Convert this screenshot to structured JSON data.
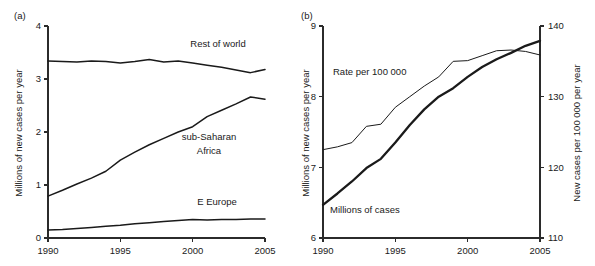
{
  "figure": {
    "panel_a_label": "(a)",
    "panel_b_label": "(b)"
  },
  "chart_data": [
    {
      "type": "line",
      "panel": "(a)",
      "title": "",
      "xlabel": "",
      "ylabel": "Millions of new cases per year",
      "xlim": [
        1990,
        2005
      ],
      "ylim": [
        0,
        4
      ],
      "xticks": [
        1990,
        1995,
        2000,
        2005
      ],
      "xtick_labels": [
        "1990",
        "1995",
        "2000",
        "2005"
      ],
      "yticks": [
        0,
        1,
        2,
        3,
        4
      ],
      "ytick_labels": [
        "0",
        "1",
        "2",
        "3",
        "4"
      ],
      "grid": false,
      "legend": "inline-annotations",
      "x": [
        1990,
        1991,
        1992,
        1993,
        1994,
        1995,
        1996,
        1997,
        1998,
        1999,
        2000,
        2001,
        2002,
        2003,
        2004,
        2005
      ],
      "series": [
        {
          "name": "Rest of world",
          "label": "Rest of world",
          "values": [
            3.34,
            3.33,
            3.32,
            3.34,
            3.33,
            3.3,
            3.33,
            3.37,
            3.32,
            3.34,
            3.3,
            3.26,
            3.22,
            3.17,
            3.12,
            3.18
          ]
        },
        {
          "name": "sub-Saharan Africa",
          "label": "sub-Saharan Africa",
          "values": [
            0.79,
            0.9,
            1.02,
            1.13,
            1.26,
            1.47,
            1.62,
            1.76,
            1.88,
            2.0,
            2.1,
            2.29,
            2.41,
            2.53,
            2.66,
            2.62
          ]
        },
        {
          "name": "E Europe",
          "label": "E Europe",
          "values": [
            0.15,
            0.16,
            0.18,
            0.2,
            0.22,
            0.24,
            0.27,
            0.29,
            0.31,
            0.33,
            0.35,
            0.34,
            0.35,
            0.35,
            0.36,
            0.36
          ]
        }
      ]
    },
    {
      "type": "line",
      "panel": "(b)",
      "title": "",
      "xlabel": "",
      "ylabel": "Millions of new cases per year",
      "y2label": "New cases per 100 000 per year",
      "xlim": [
        1990,
        2005
      ],
      "ylim": [
        6,
        9
      ],
      "y2lim": [
        110,
        140
      ],
      "xticks": [
        1990,
        1995,
        2000,
        2005
      ],
      "xtick_labels": [
        "1990",
        "1995",
        "2000",
        "2005"
      ],
      "yticks": [
        6,
        7,
        8,
        9
      ],
      "ytick_labels": [
        "6",
        "7",
        "8",
        "9"
      ],
      "y2ticks": [
        110,
        120,
        130,
        140
      ],
      "y2tick_labels": [
        "110",
        "120",
        "130",
        "140"
      ],
      "grid": false,
      "legend": "inline-annotations",
      "x": [
        1990,
        1991,
        1992,
        1993,
        1994,
        1995,
        1996,
        1997,
        1998,
        1999,
        2000,
        2001,
        2002,
        2003,
        2004,
        2005
      ],
      "series": [
        {
          "name": "Millions of cases",
          "label": "Millions of cases",
          "axis": "left",
          "values": [
            6.47,
            6.63,
            6.8,
            6.99,
            7.12,
            7.35,
            7.6,
            7.82,
            8.0,
            8.12,
            8.28,
            8.42,
            8.53,
            8.62,
            8.72,
            8.79
          ]
        },
        {
          "name": "Rate per 100 000",
          "label": "Rate per 100 000",
          "axis": "right",
          "values": [
            122.5,
            122.9,
            123.5,
            125.8,
            126.1,
            128.5,
            130.0,
            131.5,
            132.8,
            135.0,
            135.1,
            135.8,
            136.5,
            136.6,
            136.4,
            135.9
          ]
        }
      ]
    }
  ]
}
